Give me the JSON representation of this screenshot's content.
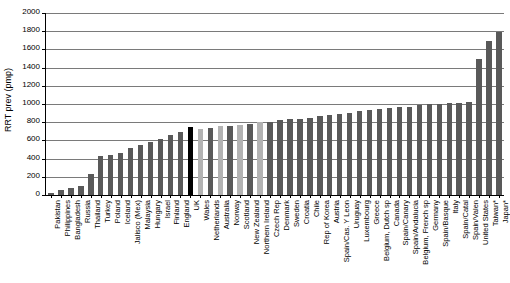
{
  "chart_data": {
    "type": "bar",
    "title": "",
    "xlabel": "",
    "ylabel": "RRT prev (pmp)",
    "ylim": [
      0,
      2000
    ],
    "yticks": [
      0,
      200,
      400,
      600,
      800,
      1000,
      1200,
      1400,
      1600,
      1800,
      2000
    ],
    "grid": true,
    "legend": false,
    "highlight_color": "#000000",
    "bar_color": "#595959",
    "light_bar_color": "#b3b3b3",
    "categories": [
      "Pakistan",
      "Philippines",
      "Bangladesh",
      "Russia",
      "Thailand",
      "Turkey",
      "Poland",
      "Iceland",
      "Jalisco (Mex)",
      "Malaysia",
      "Hungary",
      "Israel",
      "Finland",
      "England",
      "UK",
      "Wales",
      "Netherlands",
      "Australia",
      "Norway",
      "Scotland",
      "New Zealand",
      "Northern Ireland",
      "Czech Rep",
      "Denmark",
      "Sweden",
      "Croatia",
      "Chile",
      "Rep of Korea",
      "Austria",
      "Spain/Cas. Y Leon",
      "Uruguay",
      "Luxembourg",
      "Greece",
      "Belgium, Dutch sp",
      "Canada",
      "Spain/Canary",
      "Spain/Andalucia",
      "Belgium, French sp",
      "Germany",
      "Spain/Basque",
      "Italy",
      "Spain/Catal",
      "Spain/Valen",
      "United States",
      "Taiwan*",
      "Japan*"
    ],
    "values": [
      25,
      50,
      72,
      100,
      235,
      430,
      445,
      465,
      520,
      545,
      585,
      620,
      660,
      690,
      745,
      730,
      740,
      755,
      760,
      765,
      775,
      800,
      805,
      820,
      830,
      840,
      850,
      870,
      880,
      890,
      905,
      920,
      930,
      945,
      960,
      965,
      970,
      985,
      1000,
      1005,
      1010,
      1015,
      1020,
      1495,
      1690,
      1795
    ],
    "bar_styles": [
      "dark",
      "dark",
      "dark",
      "dark",
      "dark",
      "dark",
      "dark",
      "dark",
      "dark",
      "dark",
      "dark",
      "dark",
      "dark",
      "dark",
      "black",
      "light",
      "dark",
      "light",
      "dark",
      "light",
      "dark",
      "light",
      "dark",
      "dark",
      "dark",
      "dark",
      "dark",
      "dark",
      "dark",
      "dark",
      "dark",
      "dark",
      "dark",
      "dark",
      "dark",
      "dark",
      "dark",
      "dark",
      "dark",
      "dark",
      "dark",
      "dark",
      "dark",
      "dark",
      "dark",
      "dark"
    ]
  }
}
